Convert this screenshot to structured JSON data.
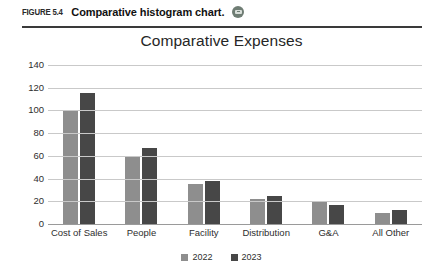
{
  "figure": {
    "number": "FIGURE 5.4",
    "caption": "Comparative histogram chart.",
    "media_icon": "media-circle-icon"
  },
  "chart_data": {
    "type": "bar",
    "title": "Comparative Expenses",
    "xlabel": "",
    "ylabel": "",
    "categories": [
      "Cost of Sales",
      "People",
      "Facility",
      "Distribution",
      "G&A",
      "All Other"
    ],
    "series": [
      {
        "name": "2022",
        "color": "#8e8e8e",
        "values": [
          100,
          60,
          35,
          22,
          20,
          10
        ]
      },
      {
        "name": "2023",
        "color": "#474747",
        "values": [
          115,
          67,
          38,
          25,
          17,
          12
        ]
      }
    ],
    "ylim": [
      0,
      140
    ],
    "yticks": [
      0,
      20,
      40,
      60,
      80,
      100,
      120,
      140
    ],
    "ytick_labels": [
      "0",
      "20",
      "40",
      "60",
      "80",
      "100",
      "120",
      "140"
    ],
    "grid": true,
    "legend_position": "bottom",
    "legend_entries": [
      "2022",
      "2023"
    ]
  },
  "colors": {
    "series_2022": "#8e8e8e",
    "series_2023": "#474747",
    "gridline": "#c9c9c9",
    "rule": "#3a3a3a",
    "background": "#ffffff"
  }
}
